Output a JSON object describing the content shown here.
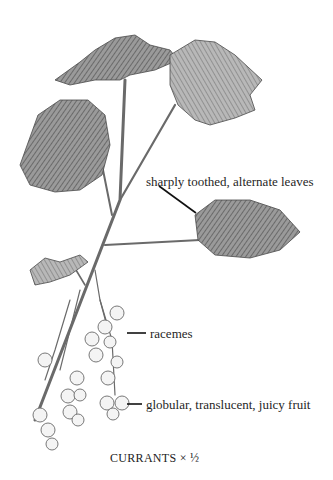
{
  "figure": {
    "labels": [
      {
        "id": "leaves",
        "text": "sharply toothed, alternate leaves"
      },
      {
        "id": "racemes",
        "text": "racemes"
      },
      {
        "id": "fruit",
        "text": "globular, translucent, juicy fruit"
      }
    ],
    "caption": "CURRANTS × ½"
  },
  "colors": {
    "background": "#ffffff",
    "ink": "#1f1f1f",
    "pencil_dark": "#4a4a4a",
    "pencil_mid": "#8a8a8a",
    "pencil_light": "#c4c4c4"
  }
}
